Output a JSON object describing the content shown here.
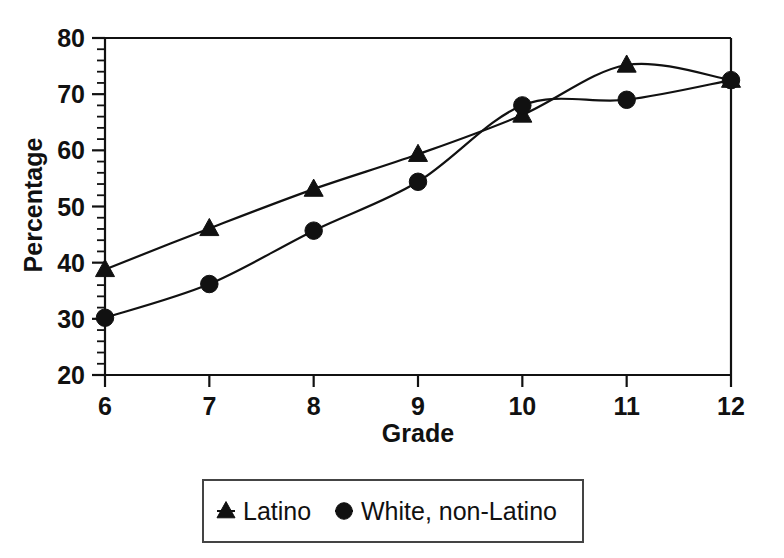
{
  "chart_data": {
    "type": "line",
    "title": "",
    "xlabel": "Grade",
    "ylabel": "Percentage",
    "x": [
      6,
      7,
      8,
      9,
      10,
      11,
      12
    ],
    "categories": [
      "6",
      "7",
      "8",
      "9",
      "10",
      "11",
      "12"
    ],
    "xlim": [
      6,
      12
    ],
    "ylim": [
      20,
      80
    ],
    "y_ticks": [
      20,
      30,
      40,
      50,
      60,
      70,
      80
    ],
    "y_tick_labels": [
      "20",
      "30",
      "40",
      "50",
      "60",
      "70",
      "80"
    ],
    "y_minor_step": 2,
    "x_ticks": [
      6,
      7,
      8,
      9,
      10,
      11,
      12
    ],
    "x_tick_labels": [
      "6",
      "7",
      "8",
      "9",
      "10",
      "11",
      "12"
    ],
    "grid": false,
    "smooth": true,
    "legend_position": "below-center",
    "series": [
      {
        "name": "Latino",
        "marker": "triangle",
        "color": "#111111",
        "values": [
          38.8,
          46.1,
          53.1,
          59.3,
          66.3,
          75.2,
          72.5
        ]
      },
      {
        "name": "White, non-Latino",
        "marker": "circle",
        "color": "#111111",
        "values": [
          30.2,
          36.2,
          45.7,
          54.4,
          68.0,
          69.0,
          72.5
        ]
      }
    ]
  },
  "axes": {
    "y_axis_title": "Percentage",
    "x_axis_title": "Grade"
  },
  "legend": {
    "entries": [
      {
        "label": "Latino",
        "marker": "triangle-marker-icon"
      },
      {
        "label": "White, non-Latino",
        "marker": "circle-marker-icon"
      }
    ]
  }
}
